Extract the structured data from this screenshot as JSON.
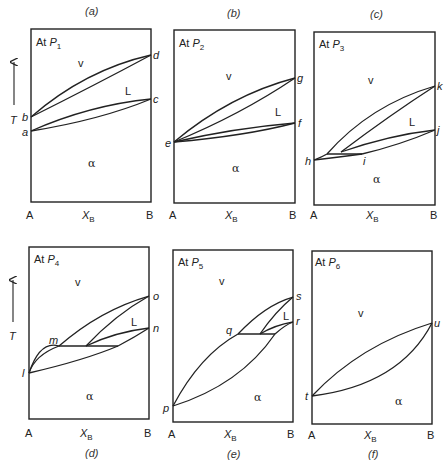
{
  "figure": {
    "axis": {
      "x_left": "A",
      "x_right": "B",
      "x_label": "X",
      "x_label_sub": "B",
      "y_label": "T"
    },
    "panels": [
      {
        "id": "a",
        "caption": "(a)",
        "title_prefix": "At ",
        "title_var": "P",
        "title_sub": "1",
        "regions": {
          "vapor": "v",
          "liquid": "L",
          "solid": "α"
        },
        "points": [
          "a",
          "b",
          "c",
          "d"
        ]
      },
      {
        "id": "b",
        "caption": "(b)",
        "title_prefix": "At ",
        "title_var": "P",
        "title_sub": "2",
        "regions": {
          "vapor": "v",
          "liquid": "L",
          "solid": "α"
        },
        "points": [
          "e",
          "f",
          "g"
        ]
      },
      {
        "id": "c",
        "caption": "(c)",
        "title_prefix": "At ",
        "title_var": "P",
        "title_sub": "3",
        "regions": {
          "vapor": "v",
          "liquid": "L",
          "solid": "α"
        },
        "points": [
          "h",
          "i",
          "j",
          "k"
        ]
      },
      {
        "id": "d",
        "caption": "(d)",
        "title_prefix": "At ",
        "title_var": "P",
        "title_sub": "4",
        "regions": {
          "vapor": "v",
          "liquid": "L",
          "solid": "α"
        },
        "points": [
          "l",
          "m",
          "n",
          "o"
        ]
      },
      {
        "id": "e",
        "caption": "(e)",
        "title_prefix": "At ",
        "title_var": "P",
        "title_sub": "5",
        "regions": {
          "vapor": "v",
          "liquid": "L",
          "solid": "α"
        },
        "points": [
          "p",
          "q",
          "r",
          "s"
        ]
      },
      {
        "id": "f",
        "caption": "(f)",
        "title_prefix": "At ",
        "title_var": "P",
        "title_sub": "6",
        "regions": {
          "vapor": "v",
          "solid": "α"
        },
        "points": [
          "t",
          "u"
        ]
      }
    ]
  }
}
